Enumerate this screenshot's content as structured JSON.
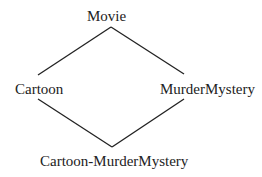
{
  "diagram": {
    "type": "class-hierarchy",
    "nodes": {
      "top": "Movie",
      "left": "Cartoon",
      "right": "MurderMystery",
      "bottom": "Cartoon-MurderMystery"
    },
    "edges": [
      [
        "Movie",
        "Cartoon"
      ],
      [
        "Movie",
        "MurderMystery"
      ],
      [
        "Cartoon",
        "Cartoon-MurderMystery"
      ],
      [
        "MurderMystery",
        "Cartoon-MurderMystery"
      ]
    ],
    "line_color": "#222222"
  }
}
